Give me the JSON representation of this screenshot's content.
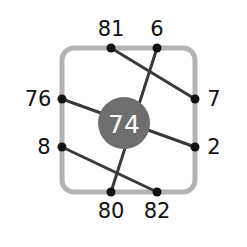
{
  "diagram": {
    "type": "node-link-crossing-diagram",
    "center_node": {
      "label": "74",
      "fill_color": "#6e6e6e",
      "text_color": "#ffffff",
      "radius": 26,
      "cx": 124,
      "cy": 123
    },
    "frame": {
      "stroke_color": "#b3b3b3",
      "stroke_width": 5,
      "corner_radius": 12,
      "x": 62,
      "y": 48,
      "width": 133,
      "height": 144
    },
    "edge_style": {
      "stroke_color": "#3a3a3a",
      "stroke_width": 3
    },
    "node_style": {
      "fill_color": "#111111",
      "radius": 4.5
    },
    "nodes": [
      {
        "id": "n81",
        "label": "81",
        "side": "top",
        "cx": 111,
        "cy": 48,
        "label_x": 111,
        "label_y": 36
      },
      {
        "id": "n6",
        "label": "6",
        "side": "top",
        "cx": 157,
        "cy": 48,
        "label_x": 157,
        "label_y": 36
      },
      {
        "id": "n7",
        "label": "7",
        "side": "right",
        "cx": 195,
        "cy": 99,
        "label_x": 214,
        "label_y": 106
      },
      {
        "id": "n2",
        "label": "2",
        "side": "right",
        "cx": 195,
        "cy": 147,
        "label_x": 214,
        "label_y": 154
      },
      {
        "id": "n82",
        "label": "82",
        "side": "bottom",
        "cx": 157,
        "cy": 192,
        "label_x": 157,
        "label_y": 218
      },
      {
        "id": "n80",
        "label": "80",
        "side": "bottom",
        "cx": 111,
        "cy": 192,
        "label_x": 111,
        "label_y": 218
      },
      {
        "id": "n8",
        "label": "8",
        "side": "left",
        "cx": 62,
        "cy": 147,
        "label_x": 44,
        "label_y": 154
      },
      {
        "id": "n76",
        "label": "76",
        "side": "left",
        "cx": 62,
        "cy": 99,
        "label_x": 38,
        "label_y": 106
      }
    ],
    "edges": [
      {
        "id": "e1",
        "from": "n81",
        "to": "n7",
        "x1": 111,
        "y1": 48,
        "x2": 195,
        "y2": 99
      },
      {
        "id": "e2",
        "from": "n6",
        "to": "n80",
        "x1": 157,
        "y1": 48,
        "x2": 111,
        "y2": 192
      },
      {
        "id": "e3",
        "from": "n76",
        "to": "n2",
        "x1": 62,
        "y1": 99,
        "x2": 195,
        "y2": 147
      },
      {
        "id": "e4",
        "from": "n8",
        "to": "n82",
        "x1": 62,
        "y1": 147,
        "x2": 157,
        "y2": 192
      }
    ]
  }
}
